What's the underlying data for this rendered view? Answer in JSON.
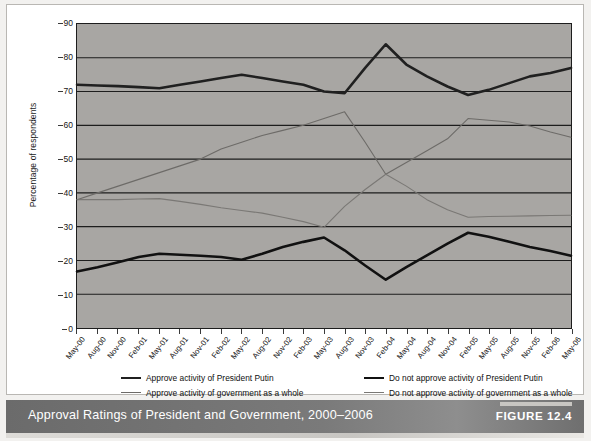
{
  "figure": {
    "caption": "Approval Ratings of President and Government, 2000–2006",
    "tag": "FIGURE 12.4"
  },
  "chart_data": {
    "type": "line",
    "title": "Approval Ratings of President and Government, 2000–2006",
    "xlabel": "",
    "ylabel": "Percentage of respondents",
    "ylim": [
      0,
      90
    ],
    "ytick_step": 10,
    "yticks": [
      0,
      10,
      20,
      30,
      40,
      50,
      60,
      70,
      80,
      90
    ],
    "grid": true,
    "legend_position": "bottom",
    "plot_background": "#a8a6a3",
    "categories": [
      "May-00",
      "Aug-00",
      "Nov-00",
      "Feb-01",
      "May-01",
      "Aug-01",
      "Nov-01",
      "Feb-02",
      "May-02",
      "Aug-02",
      "Nov-02",
      "Feb-03",
      "May-03",
      "Aug-03",
      "Nov-03",
      "Feb-04",
      "May-04",
      "Aug-04",
      "Nov-04",
      "Feb-05",
      "May-05",
      "Aug-05",
      "Nov-05",
      "Feb-06",
      "May-06"
    ],
    "series": [
      {
        "name": "Approve  activity of President Putin",
        "color": "#202020",
        "width": 2.6,
        "values": [
          72,
          71.8,
          71.6,
          71.3,
          71,
          72,
          73,
          74,
          75,
          74,
          73,
          72,
          70,
          69.5,
          77,
          84,
          78,
          74.5,
          71.5,
          69,
          70.5,
          72.5,
          74.5,
          75.5,
          77
        ]
      },
      {
        "name": "Do not approve activity of President Putin",
        "color": "#111111",
        "width": 2.6,
        "values": [
          16.7,
          18,
          19.5,
          21,
          22,
          21.7,
          21.4,
          21,
          20.2,
          22,
          24,
          25.5,
          26.8,
          23,
          18.5,
          14.3,
          18,
          21.5,
          25,
          28.2,
          27,
          25.5,
          24,
          22.8,
          21.4
        ]
      },
      {
        "name": "Approve  activity of government as a whole",
        "color": "#6d6b68",
        "width": 1.1,
        "values": [
          38,
          40,
          42,
          44,
          46,
          48,
          50,
          53,
          55,
          57,
          58.5,
          60,
          62,
          64,
          55,
          45.5,
          49,
          52.5,
          56,
          62,
          61.5,
          61,
          59.8,
          58,
          56.5
        ]
      },
      {
        "name": "Do not approve activity of government as a whole",
        "color": "#7a7875",
        "width": 1.1,
        "values": [
          38,
          38,
          38,
          38.2,
          38.3,
          37.5,
          36.6,
          35.6,
          34.8,
          34,
          32.8,
          31.5,
          29.8,
          36,
          41,
          45.5,
          42,
          38,
          35,
          32.8,
          33,
          33.1,
          33.2,
          33.3,
          33.4
        ]
      }
    ]
  },
  "legend": {
    "items": [
      {
        "label": "Approve  activity of President Putin",
        "color": "#202020",
        "width": 2.6
      },
      {
        "label": "Do not approve activity of President Putin",
        "color": "#111111",
        "width": 2.6
      },
      {
        "label": "Approve  activity of government as a whole",
        "color": "#6d6b68",
        "width": 1.1
      },
      {
        "label": "Do not approve activity of government as a whole",
        "color": "#7a7875",
        "width": 1.1
      }
    ]
  }
}
